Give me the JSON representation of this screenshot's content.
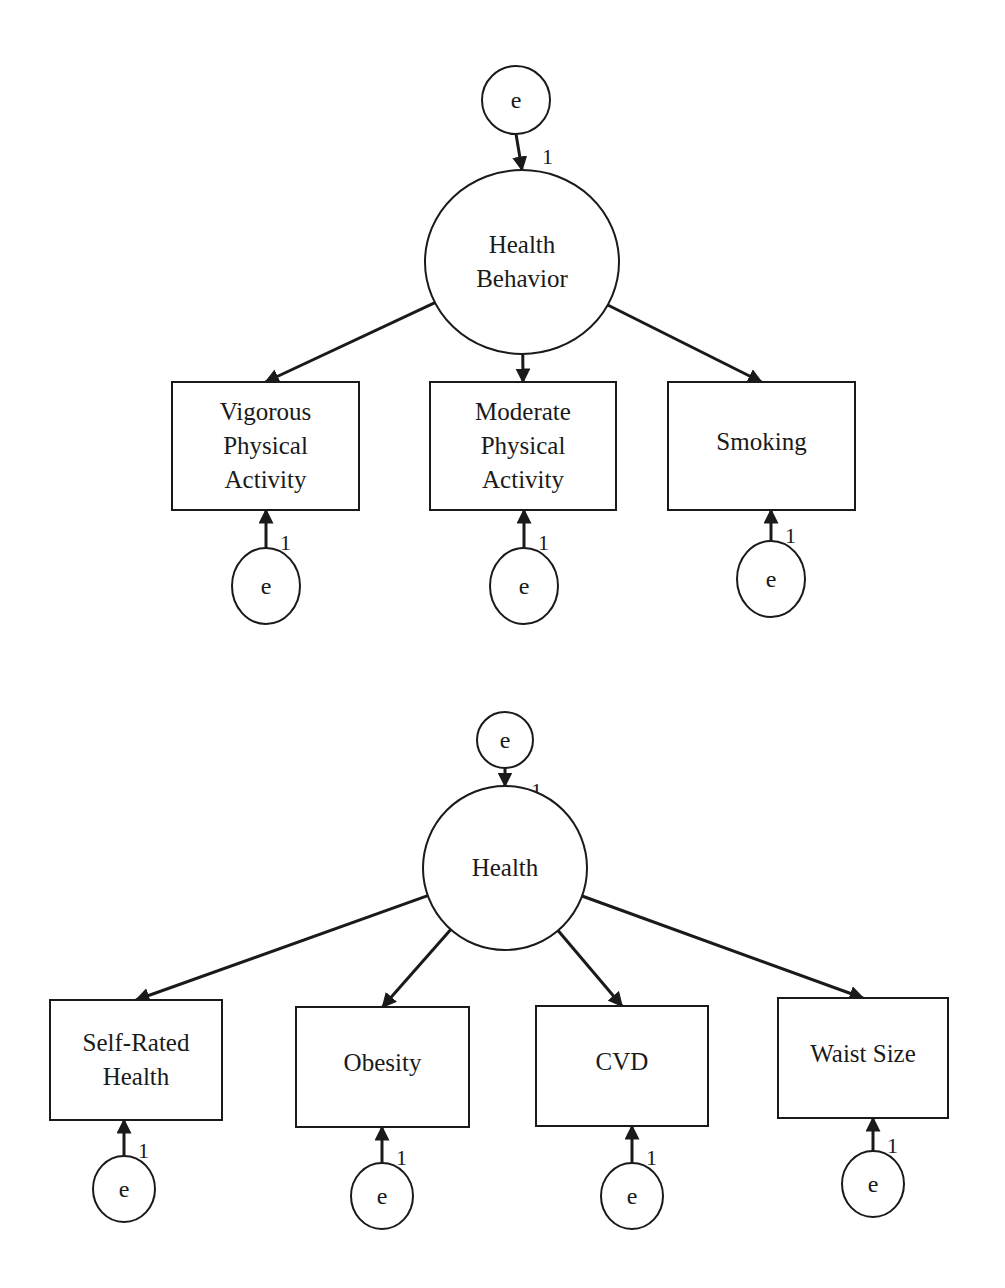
{
  "diagrams": [
    {
      "name": "health-behavior-model",
      "latent": {
        "label_lines": [
          "Health",
          "Behavior"
        ],
        "cx": 522,
        "cy": 262,
        "rx": 97,
        "ry": 92
      },
      "latent_error": {
        "label": "e",
        "cx": 516,
        "cy": 100,
        "r": 34,
        "weight": "1"
      },
      "indicators": [
        {
          "label_lines": [
            "Vigorous",
            "Physical",
            "Activity"
          ],
          "x": 172,
          "y": 382,
          "w": 187,
          "h": 128,
          "error": {
            "label": "e",
            "cx": 266,
            "cy": 586,
            "rx": 34,
            "ry": 38,
            "weight": "1"
          }
        },
        {
          "label_lines": [
            "Moderate",
            "Physical",
            "Activity"
          ],
          "x": 430,
          "y": 382,
          "w": 186,
          "h": 128,
          "error": {
            "label": "e",
            "cx": 524,
            "cy": 586,
            "rx": 34,
            "ry": 38,
            "weight": "1"
          }
        },
        {
          "label_lines": [
            "Smoking"
          ],
          "x": 668,
          "y": 382,
          "w": 187,
          "h": 128,
          "error": {
            "label": "e",
            "cx": 771,
            "cy": 579,
            "rx": 34,
            "ry": 38,
            "weight": "1"
          }
        }
      ]
    },
    {
      "name": "health-model",
      "latent": {
        "label_lines": [
          "Health"
        ],
        "cx": 505,
        "cy": 868,
        "rx": 82,
        "ry": 82
      },
      "latent_error": {
        "label": "e",
        "cx": 505,
        "cy": 740,
        "r": 28,
        "weight": "1"
      },
      "indicators": [
        {
          "label_lines": [
            "Self-Rated",
            "Health"
          ],
          "x": 50,
          "y": 1000,
          "w": 172,
          "h": 120,
          "error": {
            "label": "e",
            "cx": 124,
            "cy": 1189,
            "rx": 31,
            "ry": 33,
            "weight": "1"
          }
        },
        {
          "label_lines": [
            "Obesity"
          ],
          "x": 296,
          "y": 1007,
          "w": 173,
          "h": 120,
          "error": {
            "label": "e",
            "cx": 382,
            "cy": 1196,
            "rx": 31,
            "ry": 33,
            "weight": "1"
          }
        },
        {
          "label_lines": [
            "CVD"
          ],
          "x": 536,
          "y": 1006,
          "w": 172,
          "h": 120,
          "error": {
            "label": "e",
            "cx": 632,
            "cy": 1196,
            "rx": 31,
            "ry": 33,
            "weight": "1"
          }
        },
        {
          "label_lines": [
            "Waist Size"
          ],
          "x": 778,
          "y": 998,
          "w": 170,
          "h": 120,
          "error": {
            "label": "e",
            "cx": 873,
            "cy": 1184,
            "rx": 31,
            "ry": 33,
            "weight": "1"
          }
        }
      ]
    }
  ]
}
